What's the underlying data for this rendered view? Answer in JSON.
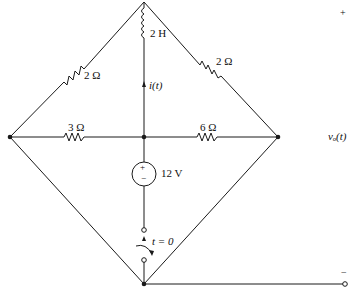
{
  "diagram": {
    "type": "circuit",
    "components": {
      "inductor": {
        "label": "2 H"
      },
      "resistor_top_left": {
        "label": "2 Ω"
      },
      "resistor_top_right": {
        "label": "2 Ω"
      },
      "resistor_left": {
        "label": "3 Ω"
      },
      "resistor_right": {
        "label": "6 Ω"
      },
      "voltage_source": {
        "label": "12 V",
        "plus": "+",
        "minus": "−"
      },
      "switch": {
        "label": "t = 0"
      },
      "current": {
        "label": "i(t)"
      }
    },
    "output": {
      "label": "vₒ(t)",
      "plus": "+",
      "minus": "−"
    }
  },
  "colors": {
    "stroke": "#1a1a1a",
    "background": "#ffffff"
  }
}
